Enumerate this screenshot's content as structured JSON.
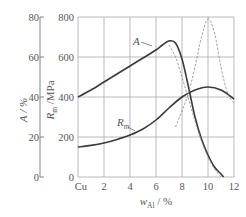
{
  "chart_data": {
    "type": "line",
    "title": "",
    "xlabel": "w_Al / %",
    "xlabel_main": "w",
    "xlabel_sub": "Al",
    "xlabel_unit": " / %",
    "ylabel_left": "A / %",
    "ylabel_right_main": "R",
    "ylabel_right_sub": "m",
    "ylabel_right_unit": " /MPa",
    "x_ticks": [
      "Cu",
      "2",
      "4",
      "6",
      "8",
      "10",
      "12"
    ],
    "x_tick_values": [
      0,
      2,
      4,
      6,
      8,
      10,
      12
    ],
    "y_ticks_A": [
      "0",
      "20",
      "40",
      "60",
      "80"
    ],
    "y_ticks_Rm": [
      "0",
      "200",
      "400",
      "600",
      "800"
    ],
    "xlim": [
      0,
      12
    ],
    "ylim_Rm": [
      0,
      800
    ],
    "ylim_A": [
      0,
      80
    ],
    "grid": true,
    "series": [
      {
        "name": "A",
        "label": "A",
        "style": "solid",
        "axis": "A",
        "x": [
          0,
          1,
          2,
          3,
          4,
          5,
          6,
          6.5,
          7,
          7.5,
          8,
          8.5,
          9,
          9.5,
          10,
          10.5,
          11,
          11.2
        ],
        "values": [
          40,
          43.5,
          47.5,
          51.5,
          55.5,
          59.5,
          63.5,
          66,
          68,
          67,
          59,
          45,
          30,
          19,
          11,
          5,
          1.5,
          0
        ]
      },
      {
        "name": "Rm",
        "label": "R_m",
        "style": "solid",
        "axis": "Rm",
        "x": [
          0,
          1,
          2,
          3,
          4,
          5,
          6,
          7,
          8,
          9,
          10,
          11,
          12
        ],
        "values": [
          150,
          158,
          170,
          188,
          210,
          240,
          285,
          345,
          400,
          435,
          450,
          435,
          390
        ]
      },
      {
        "name": "A (dashed)",
        "label": "",
        "style": "dashed",
        "axis": "A",
        "x": [
          7.5,
          8,
          8.5,
          9,
          9.5,
          10,
          10.5,
          11,
          11.5,
          12
        ],
        "values": [
          25,
          33,
          42,
          55,
          70,
          79,
          72,
          55,
          42,
          37
        ]
      },
      {
        "name": "Rm (dashed)",
        "label": "",
        "style": "dashed",
        "axis": "Rm",
        "x": [
          7,
          7.5,
          8,
          8.5,
          9,
          9.5,
          10,
          10.5,
          11
        ],
        "values": [
          660,
          600,
          500,
          390,
          280,
          180,
          100,
          40,
          0
        ]
      }
    ]
  }
}
